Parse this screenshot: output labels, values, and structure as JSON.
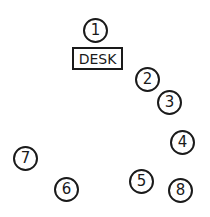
{
  "diagram": {
    "type": "seating-arrangement",
    "desk": {
      "label": "DESK"
    },
    "seats": [
      {
        "label": "1",
        "x": 96,
        "y": 31
      },
      {
        "label": "2",
        "x": 148,
        "y": 80
      },
      {
        "label": "3",
        "x": 170,
        "y": 103
      },
      {
        "label": "4",
        "x": 183,
        "y": 143
      },
      {
        "label": "5",
        "x": 142,
        "y": 182
      },
      {
        "label": "6",
        "x": 67,
        "y": 190
      },
      {
        "label": "7",
        "x": 26,
        "y": 159
      },
      {
        "label": "8",
        "x": 181,
        "y": 191
      }
    ]
  }
}
